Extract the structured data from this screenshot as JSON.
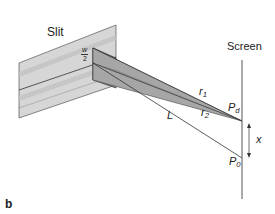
{
  "figure": {
    "panel_label": "b",
    "labels": {
      "slit": "Slit",
      "screen": "Screen",
      "half_width_num": "w",
      "half_width_den": "2",
      "r1": "r",
      "r1_sub": "1",
      "r2": "r",
      "r2_sub": "2",
      "L": "L",
      "Pd": "P",
      "Pd_sub": "d",
      "P0": "P",
      "P0_sub": "0",
      "x": "x"
    },
    "colors": {
      "slit_face": "#d4d4d4",
      "slit_band": "#bdbdbd",
      "beam": "#9a9a9a",
      "aperture_dark": "#8c8c8c",
      "line": "#333333"
    }
  }
}
